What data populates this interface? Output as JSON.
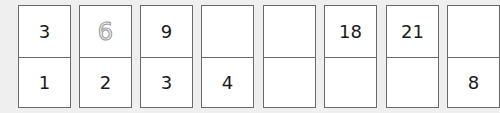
{
  "cards": [
    {
      "top": "3",
      "bottom": "1",
      "top_style": "normal"
    },
    {
      "top": "6",
      "bottom": "2",
      "top_style": "dotted"
    },
    {
      "top": "9",
      "bottom": "3",
      "top_style": "normal"
    },
    {
      "top": "",
      "bottom": "4",
      "top_style": "normal"
    },
    {
      "top": "",
      "bottom": "",
      "top_style": "normal"
    },
    {
      "top": "18",
      "bottom": "",
      "top_style": "normal"
    },
    {
      "top": "21",
      "bottom": "",
      "top_style": "normal"
    },
    {
      "top": "",
      "bottom": "8",
      "top_style": "normal"
    }
  ]
}
